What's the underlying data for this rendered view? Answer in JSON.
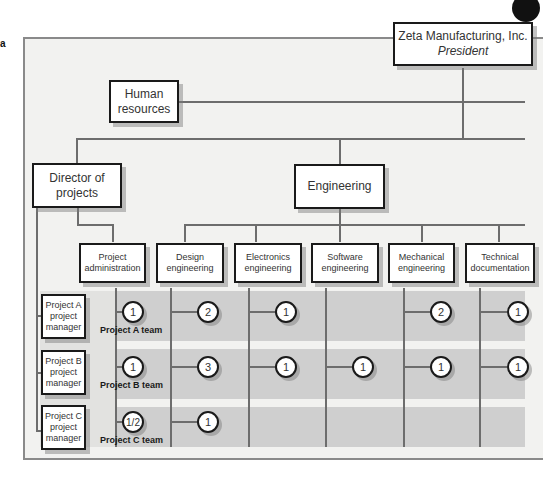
{
  "figure_marker": "a",
  "president": {
    "line1": "Zeta Manufacturing, Inc.",
    "line2": "President"
  },
  "staff": [
    {
      "id": "hr",
      "label": "Human\nresources"
    }
  ],
  "level2": [
    {
      "id": "director",
      "label": "Director of\nprojects"
    },
    {
      "id": "engineering",
      "label": "Engineering"
    }
  ],
  "columns": [
    {
      "id": "project-admin",
      "label": "Project\nadministration"
    },
    {
      "id": "design",
      "label": "Design\nengineering"
    },
    {
      "id": "electronics",
      "label": "Electronics\nengineering"
    },
    {
      "id": "software",
      "label": "Software\nengineering"
    },
    {
      "id": "mechanical",
      "label": "Mechanical\nengineering"
    },
    {
      "id": "technical-doc",
      "label": "Technical\ndocumentation"
    }
  ],
  "projects": [
    {
      "manager": "Project A\nproject\nmanager",
      "team_label": "Project A team",
      "allocations": [
        "1",
        "2",
        "1",
        "",
        "2",
        "1"
      ]
    },
    {
      "manager": "Project B\nproject\nmanager",
      "team_label": "Project B team",
      "allocations": [
        "1",
        "3",
        "1",
        "1",
        "1",
        "1"
      ]
    },
    {
      "manager": "Project C\nproject\nmanager",
      "team_label": "Project C team",
      "allocations": [
        "1/2",
        "1",
        "",
        "",
        "",
        ""
      ]
    }
  ],
  "colors": {
    "band": "#cfcfcf",
    "frame_bg": "#f2f2f0",
    "line": "#6d6d6d",
    "box_border": "#1a1a1a"
  }
}
